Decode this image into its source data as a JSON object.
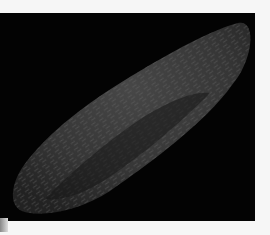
{
  "image": {
    "description": "Scanning electron micrograph-style image of an elongated, spindle-shaped hairy body on a black background",
    "colors": {
      "background": "#030303",
      "specimen": "#3a3a3a",
      "highlight": "#6a6a6a",
      "page": "#f6f6f6"
    }
  }
}
